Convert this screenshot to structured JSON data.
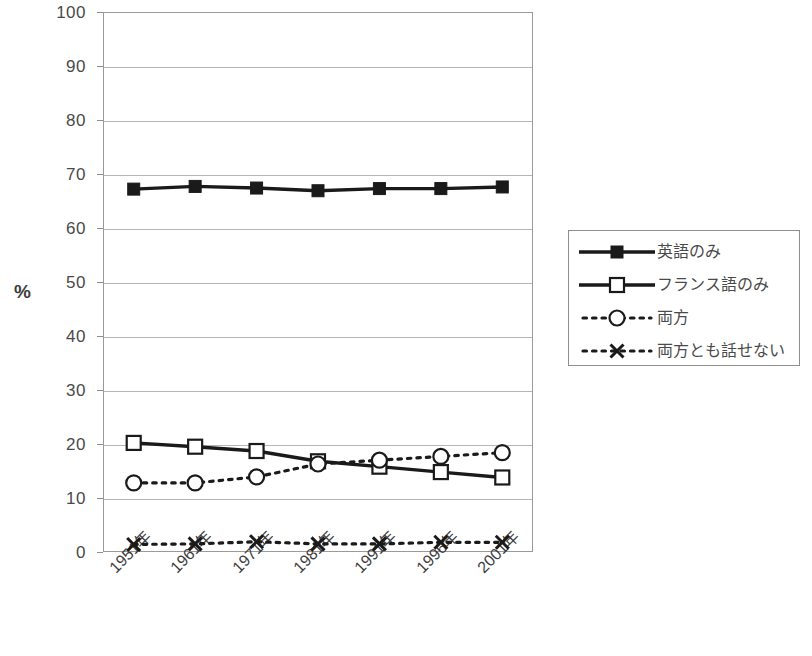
{
  "chart_data": {
    "type": "line",
    "title": "",
    "xlabel": "",
    "ylabel": "%",
    "ylim": [
      0,
      100
    ],
    "ytick_step": 10,
    "yticks": [
      100,
      90,
      80,
      70,
      60,
      50,
      40,
      30,
      20,
      10,
      0
    ],
    "grid": true,
    "legend_position": "right",
    "categories": [
      "1951年",
      "1961年",
      "1971年",
      "1981年",
      "1991年",
      "1996年",
      "2001年"
    ],
    "series": [
      {
        "name": "英語のみ",
        "marker": "filled-square",
        "line_style": "solid",
        "values": [
          67.2,
          67.7,
          67.4,
          66.9,
          67.3,
          67.3,
          67.6
        ]
      },
      {
        "name": "フランス語のみ",
        "marker": "open-square",
        "line_style": "solid",
        "values": [
          20.2,
          19.5,
          18.7,
          16.8,
          15.8,
          14.8,
          13.8
        ]
      },
      {
        "name": "両方",
        "marker": "open-circle",
        "line_style": "dotted",
        "values": [
          12.8,
          12.8,
          13.9,
          16.3,
          17.0,
          17.7,
          18.4
        ]
      },
      {
        "name": "両方とも話せない",
        "marker": "cross",
        "line_style": "dotted",
        "values": [
          1.4,
          1.5,
          1.9,
          1.5,
          1.5,
          1.8,
          1.8
        ]
      }
    ]
  },
  "legend": {
    "items": [
      {
        "label": "英語のみ",
        "marker": "filled-square",
        "line_style": "solid"
      },
      {
        "label": "フランス語のみ",
        "marker": "open-square",
        "line_style": "solid"
      },
      {
        "label": "両方",
        "marker": "open-circle",
        "line_style": "dotted"
      },
      {
        "label": "両方とも話せない",
        "marker": "cross",
        "line_style": "dotted"
      }
    ]
  },
  "axis": {
    "y_title": "%",
    "y_labels": [
      "100",
      "90",
      "80",
      "70",
      "60",
      "50",
      "40",
      "30",
      "20",
      "10",
      "0"
    ],
    "x_labels": [
      "1951年",
      "1961年",
      "1971年",
      "1981年",
      "1991年",
      "1996年",
      "2001年"
    ]
  },
  "colors": {
    "series_line": "#1a1a1a",
    "grid": "#b5b5b5",
    "frame": "#9a9a9a",
    "text": "#3c3c3c",
    "plot_background": "#ffffff"
  },
  "caption_strip": ""
}
